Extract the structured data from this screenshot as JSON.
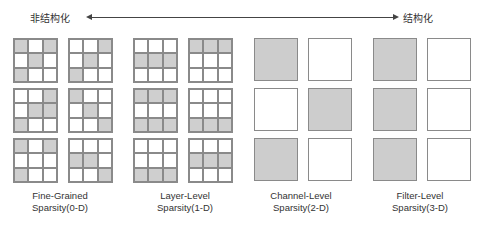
{
  "header": {
    "left_label": "非结构化",
    "right_label": "结构化"
  },
  "colors": {
    "pruned": "#cfcfcf",
    "kept": "#ffffff",
    "border": "#8a8a8a"
  },
  "groups": [
    {
      "caption_line1": "Fine-Grained",
      "caption_line2": "Sparsity(0-D)",
      "type": "grid3x3",
      "rows": [
        [
          [
            [
              1,
              0,
              1
            ],
            [
              0,
              1,
              0
            ],
            [
              1,
              0,
              0
            ]
          ],
          [
            [
              0,
              0,
              1
            ],
            [
              0,
              1,
              0
            ],
            [
              1,
              0,
              0
            ]
          ]
        ],
        [
          [
            [
              0,
              0,
              1
            ],
            [
              0,
              1,
              1
            ],
            [
              1,
              0,
              0
            ]
          ],
          [
            [
              1,
              0,
              0
            ],
            [
              0,
              1,
              0
            ],
            [
              0,
              0,
              1
            ]
          ]
        ],
        [
          [
            [
              1,
              0,
              1
            ],
            [
              0,
              0,
              0
            ],
            [
              1,
              0,
              0
            ]
          ],
          [
            [
              0,
              0,
              0
            ],
            [
              1,
              1,
              0
            ],
            [
              0,
              0,
              1
            ]
          ]
        ]
      ]
    },
    {
      "caption_line1": "Layer-Level",
      "caption_line2": "Sparsity(1-D)",
      "type": "grid3x3",
      "rows": [
        [
          [
            [
              0,
              0,
              0
            ],
            [
              1,
              1,
              1
            ],
            [
              0,
              0,
              0
            ]
          ],
          [
            [
              1,
              1,
              1
            ],
            [
              0,
              0,
              0
            ],
            [
              0,
              0,
              0
            ]
          ]
        ],
        [
          [
            [
              1,
              1,
              1
            ],
            [
              0,
              0,
              0
            ],
            [
              1,
              1,
              1
            ]
          ],
          [
            [
              0,
              0,
              0
            ],
            [
              0,
              0,
              0
            ],
            [
              1,
              1,
              1
            ]
          ]
        ],
        [
          [
            [
              0,
              0,
              0
            ],
            [
              0,
              0,
              0
            ],
            [
              1,
              1,
              1
            ]
          ],
          [
            [
              0,
              0,
              0
            ],
            [
              1,
              1,
              1
            ],
            [
              0,
              0,
              0
            ]
          ]
        ]
      ]
    },
    {
      "caption_line1": "Channel-Level",
      "caption_line2": "Sparsity(2-D)",
      "type": "square",
      "rows": [
        [
          1,
          0
        ],
        [
          0,
          1
        ],
        [
          1,
          0
        ]
      ]
    },
    {
      "caption_line1": "Filter-Level",
      "caption_line2": "Sparsity(3-D)",
      "type": "square",
      "rows": [
        [
          1,
          0
        ],
        [
          1,
          0
        ],
        [
          1,
          0
        ]
      ]
    }
  ]
}
